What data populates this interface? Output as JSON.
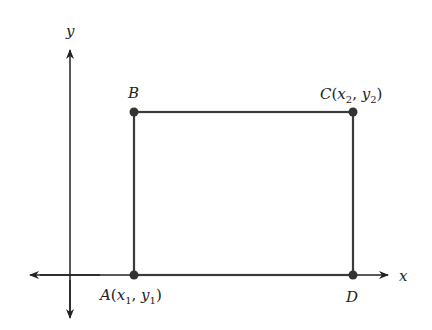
{
  "diagram": {
    "type": "rectangle-on-coordinate-plane",
    "axes": {
      "x_label": "x",
      "y_label": "y"
    },
    "points": [
      {
        "id": "A",
        "label": "A",
        "coords_text": "(x1, y1)",
        "var_x": "x",
        "sub_x": "1",
        "var_y": "y",
        "sub_y": "1"
      },
      {
        "id": "B",
        "label": "B"
      },
      {
        "id": "C",
        "label": "C",
        "coords_text": "(x2, y2)",
        "var_x": "x",
        "sub_x": "2",
        "var_y": "y",
        "sub_y": "2"
      },
      {
        "id": "D",
        "label": "D"
      }
    ],
    "colors": {
      "line": "#3a3a3a",
      "point": "#333333",
      "axis": "#222222"
    }
  }
}
